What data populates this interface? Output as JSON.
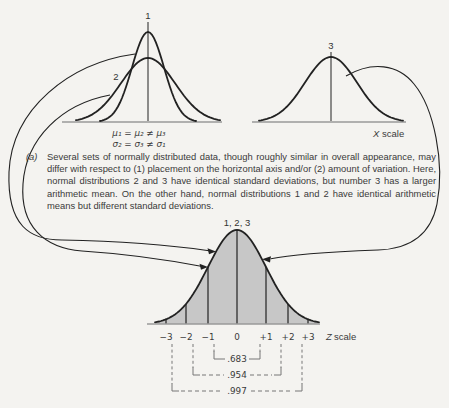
{
  "colors": {
    "background": "#f4f3f0",
    "line": "#222222",
    "axis": "#9a9a9a",
    "fill": "#c7c7c7",
    "dashed": "#767676"
  },
  "top_left": {
    "label_1": "1",
    "label_2": "2",
    "mean_eq": "μ₁ = μ₂ ≠ μ₃",
    "sd_eq": "σ₂ = σ₃ ≠ σ₁"
  },
  "top_right": {
    "label_3": "3",
    "axis_var": "X",
    "axis_word": "scale"
  },
  "caption": {
    "tag": "(a)",
    "text": "Several sets of normally distributed data, though roughly similar in overall appearance, may differ with respect to (1) placement on the horizontal axis and/or (2) amount of variation. Here, normal distributions 2 and 3 have identical standard deviations, but number 3 has a larger arithmetic mean. On the other hand, normal distributions 1 and 2 have identical arithmetic means but different standard deviations."
  },
  "bottom": {
    "peak_label": "1, 2, 3",
    "axis_var": "Z",
    "axis_word": "scale",
    "ticks": [
      "−3",
      "−2",
      "−1",
      "0",
      "+1",
      "+2",
      "+3"
    ],
    "proportions": {
      "one_sigma": ".683",
      "two_sigma": ".954",
      "three_sigma": ".997"
    }
  }
}
